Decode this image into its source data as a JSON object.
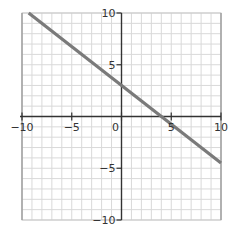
{
  "chart_data": {
    "type": "line",
    "title": "",
    "xlabel": "",
    "ylabel": "",
    "xlim": [
      -10,
      10
    ],
    "ylim": [
      -10,
      10
    ],
    "grid": true,
    "grid_step": 1,
    "x_ticks": [
      -10,
      -5,
      0,
      5,
      10
    ],
    "y_ticks": [
      -10,
      -5,
      5,
      10
    ],
    "x_tick_labels": [
      "−10",
      "−5",
      "0",
      "5",
      "10"
    ],
    "y_tick_labels": [
      "−10",
      "−5",
      "5",
      "10"
    ],
    "series": [
      {
        "name": "line",
        "equation": "y = -0.75x + 3",
        "slope": -0.75,
        "intercept": 3,
        "x": [
          -9.33,
          10
        ],
        "y": [
          10,
          -4.5
        ],
        "color": "#7a7a7a"
      }
    ],
    "legend": null
  },
  "colors": {
    "grid": "#d9d9d9",
    "axis": "#333333",
    "line": "#7a7a7a",
    "background": "#ffffff"
  }
}
